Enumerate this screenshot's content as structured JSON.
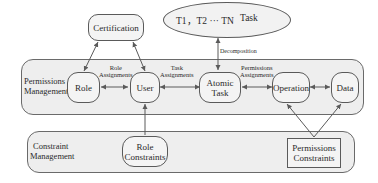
{
  "diagram": {
    "panels": {
      "permissions": {
        "label_line1": "Permissions",
        "label_line2": "Management"
      },
      "constraints": {
        "label_line1": "Constraint",
        "label_line2": "Management"
      }
    },
    "nodes": {
      "certification": "Certification",
      "task_series": "T1，T2 ··· TN",
      "task_label": "Task",
      "role": "Role",
      "user": "User",
      "atomic_task_line1": "Atomic",
      "atomic_task_line2": "Task",
      "operation": "Operation",
      "data": "Data",
      "role_constraints_line1": "Role",
      "role_constraints_line2": "Constraints",
      "permissions_constraints_line1": "Permissions",
      "permissions_constraints_line2": "Constraints"
    },
    "edges": {
      "role_assignments_line1": "Role",
      "role_assignments_line2": "Assignments",
      "task_assignments_line1": "Task",
      "task_assignments_line2": "Assignments",
      "permissions_assignments_line1": "Permissions",
      "permissions_assignments_line2": "Assignments",
      "decomposition": "Decomposition"
    }
  }
}
